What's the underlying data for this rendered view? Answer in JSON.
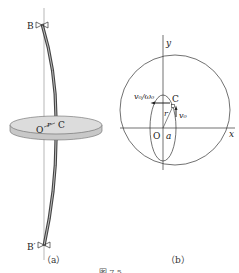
{
  "figure": {
    "panel_a": {
      "caption": "（a）",
      "labels": {
        "top_bearing": "B",
        "bottom_bearing": "B′",
        "center": "O",
        "shaft_point": "C",
        "radius": "r"
      }
    },
    "panel_b": {
      "caption": "（b）",
      "labels": {
        "y_axis": "y",
        "x_axis": "x",
        "origin": "O",
        "shaft_point": "C",
        "radius": "r",
        "semi_axis": "a",
        "velocity": "v₀",
        "velocity_ratio": "v₀/ω₀"
      }
    },
    "figure_caption": "图 7.5  ……"
  },
  "colors": {
    "line": "#333333",
    "disk_fill": "#d9d9d9",
    "disk_edge": "#bdbdbd",
    "shaft": "#555555"
  }
}
